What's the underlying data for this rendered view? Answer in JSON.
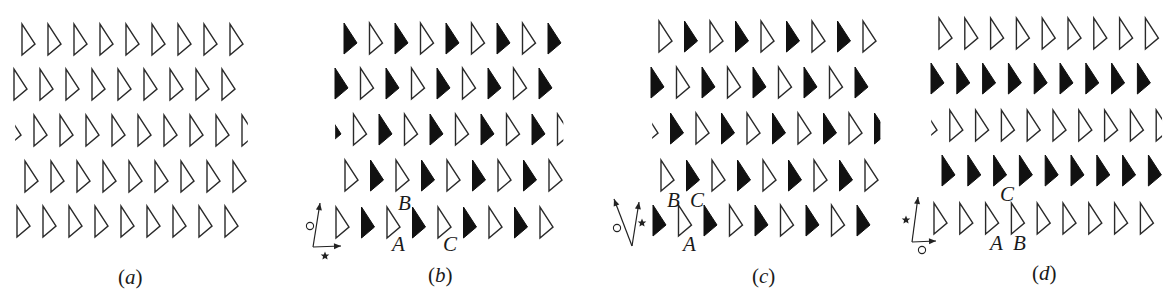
{
  "figure": {
    "triangle": {
      "width": 13,
      "height": 31,
      "apex_dy": 20
    },
    "colors": {
      "outline_stroke": "#2a2a2a",
      "filled": "#111111",
      "background": "#ffffff"
    },
    "panels": [
      {
        "id": "a",
        "caption": {
          "open": "(",
          "letter": "a",
          "close": ")",
          "x": 118,
          "y": 284
        },
        "rows": [
          {
            "y": 24,
            "x0": 22,
            "dx": 26,
            "pattern": [
              "O",
              "O",
              "O",
              "O",
              "O",
              "O",
              "O",
              "O",
              "O"
            ]
          },
          {
            "y": 69,
            "x0": 14,
            "dx": 26,
            "pattern": [
              "O",
              "O",
              "O",
              "O",
              "O",
              "O",
              "O",
              "O",
              "O"
            ]
          },
          {
            "y": 115,
            "x0": 8,
            "dx": 26,
            "pattern": [
              "o",
              "O",
              "O",
              "O",
              "O",
              "O",
              "O",
              "O",
              "O",
              "o"
            ]
          },
          {
            "y": 161,
            "x0": 25,
            "dx": 26,
            "pattern": [
              "O",
              "O",
              "O",
              "O",
              "O",
              "O",
              "O",
              "O",
              "O"
            ]
          },
          {
            "y": 206,
            "x0": 17,
            "dx": 26,
            "pattern": [
              "O",
              "O",
              "O",
              "O",
              "O",
              "O",
              "O",
              "O",
              "O"
            ]
          }
        ],
        "axes": null,
        "labels": []
      },
      {
        "id": "b",
        "caption": {
          "open": "(",
          "letter": "b",
          "close": ")",
          "x": 428,
          "y": 282
        },
        "rows": [
          {
            "y": 23,
            "x0": 344,
            "dx": 25.5,
            "pattern": [
              "F",
              "O",
              "F",
              "O",
              "F",
              "O",
              "F",
              "O",
              "F"
            ]
          },
          {
            "y": 68,
            "x0": 335,
            "dx": 25.5,
            "pattern": [
              "F",
              "O",
              "F",
              "O",
              "F",
              "O",
              "F",
              "O",
              "F"
            ]
          },
          {
            "y": 114,
            "x0": 328,
            "dx": 25.5,
            "pattern": [
              "f",
              "O",
              "F",
              "O",
              "F",
              "O",
              "F",
              "O",
              "F",
              "o"
            ]
          },
          {
            "y": 160,
            "x0": 345,
            "dx": 25.5,
            "pattern": [
              "O",
              "F",
              "O",
              "F",
              "O",
              "F",
              "O",
              "F",
              "O"
            ]
          },
          {
            "y": 207,
            "x0": 336,
            "dx": 25.5,
            "pattern": [
              "O",
              "F",
              "O",
              "F",
              "O",
              "F",
              "O",
              "F",
              "O"
            ]
          }
        ],
        "axes": {
          "origin": [
            313,
            247
          ],
          "arms": [
            {
              "to": [
                320,
                203
              ],
              "symbol": "circle",
              "sym_pos": [
                310,
                226
              ]
            },
            {
              "to": [
                341,
                246
              ],
              "symbol": "star",
              "sym_pos": [
                325,
                256
              ]
            }
          ]
        },
        "labels": [
          {
            "text": "B",
            "x": 398,
            "y": 210
          },
          {
            "text": "A",
            "x": 392,
            "y": 251
          },
          {
            "text": "C",
            "x": 443,
            "y": 251
          }
        ]
      },
      {
        "id": "c",
        "caption": {
          "open": "(",
          "letter": "c",
          "close": ")",
          "x": 752,
          "y": 283
        },
        "rows": [
          {
            "y": 21,
            "x0": 659,
            "dx": 25.5,
            "pattern": [
              "O",
              "F",
              "O",
              "F",
              "O",
              "F",
              "O",
              "F",
              "O"
            ]
          },
          {
            "y": 67,
            "x0": 651,
            "dx": 25.5,
            "pattern": [
              "F",
              "O",
              "F",
              "O",
              "F",
              "O",
              "F",
              "O",
              "F"
            ]
          },
          {
            "y": 113,
            "x0": 645,
            "dx": 25.5,
            "pattern": [
              "o",
              "F",
              "O",
              "F",
              "O",
              "F",
              "O",
              "F",
              "O",
              "f"
            ]
          },
          {
            "y": 160,
            "x0": 661,
            "dx": 25.5,
            "pattern": [
              "O",
              "F",
              "O",
              "F",
              "O",
              "F",
              "O",
              "F",
              "O"
            ]
          },
          {
            "y": 205,
            "x0": 653,
            "dx": 25.5,
            "pattern": [
              "F",
              "O",
              "F",
              "O",
              "F",
              "O",
              "F",
              "O",
              "F"
            ]
          }
        ],
        "axes": {
          "origin": [
            632,
            246
          ],
          "arms": [
            {
              "to": [
                614,
                199
              ],
              "symbol": "circle",
              "sym_pos": [
                617,
                228
              ]
            },
            {
              "to": [
                639,
                202
              ],
              "symbol": "star",
              "sym_pos": [
                642,
                223
              ]
            }
          ]
        },
        "labels": [
          {
            "text": "B",
            "x": 667,
            "y": 207
          },
          {
            "text": "C",
            "x": 690,
            "y": 207
          },
          {
            "text": "A",
            "x": 683,
            "y": 251
          }
        ]
      },
      {
        "id": "d",
        "caption": {
          "open": "(",
          "letter": "d",
          "close": ")",
          "x": 1032,
          "y": 280
        },
        "rows": [
          {
            "y": 18,
            "x0": 939,
            "dx": 25.8,
            "pattern": [
              "O",
              "O",
              "O",
              "O",
              "O",
              "O",
              "O",
              "O",
              "O"
            ]
          },
          {
            "y": 63,
            "x0": 931,
            "dx": 25.8,
            "pattern": [
              "F",
              "F",
              "F",
              "F",
              "F",
              "F",
              "F",
              "F",
              "F"
            ]
          },
          {
            "y": 110,
            "x0": 924,
            "dx": 25.8,
            "pattern": [
              "o",
              "O",
              "O",
              "O",
              "O",
              "O",
              "O",
              "O",
              "O",
              "o"
            ]
          },
          {
            "y": 155,
            "x0": 942,
            "dx": 25.8,
            "pattern": [
              "F",
              "F",
              "F",
              "F",
              "F",
              "F",
              "F",
              "F",
              "F"
            ]
          },
          {
            "y": 203,
            "x0": 934,
            "dx": 25.8,
            "pattern": [
              "O",
              "O",
              "O",
              "O",
              "O",
              "O",
              "O",
              "O",
              "O"
            ]
          }
        ],
        "axes": {
          "origin": [
            912,
            242
          ],
          "arms": [
            {
              "to": [
                918,
                197
              ],
              "symbol": "star",
              "sym_pos": [
                906,
                220
              ]
            },
            {
              "to": [
                936,
                241
              ],
              "symbol": "circle",
              "sym_pos": [
                922,
                250
              ]
            }
          ]
        },
        "labels": [
          {
            "text": "C",
            "x": 1000,
            "y": 201
          },
          {
            "text": "A",
            "x": 990,
            "y": 250
          },
          {
            "text": "B",
            "x": 1013,
            "y": 250
          }
        ]
      }
    ]
  }
}
